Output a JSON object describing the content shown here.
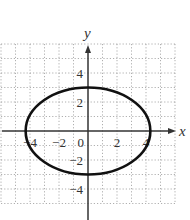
{
  "chart_data": {
    "type": "line",
    "title": "",
    "xlabel": "x",
    "ylabel": "y",
    "xlim": [
      -6,
      6
    ],
    "ylim": [
      -5,
      6
    ],
    "grid": true,
    "grid_style": "dotted",
    "x_tick_labels": [
      "-4",
      "-2",
      "0",
      "2",
      "4"
    ],
    "y_tick_labels": [
      "4",
      "2",
      "-2",
      "-4"
    ],
    "series": [
      {
        "name": "ellipse",
        "shape": "ellipse",
        "center": [
          0,
          0
        ],
        "semi_axis_x": 4.3,
        "semi_axis_y": 3,
        "color": "#111111"
      }
    ]
  },
  "colors": {
    "grid": "#9a9a9a",
    "axis": "#333333",
    "curve": "#111111"
  }
}
